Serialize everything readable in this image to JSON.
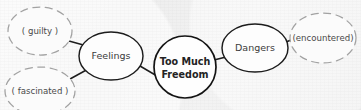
{
  "diagram": {
    "type": "concept-map",
    "background_color": "#f1f1f1",
    "ink_color": "#1c1c1c",
    "dashed_color": "#a2a2a2",
    "nodes": [
      {
        "id": "center",
        "label": "Too Much Freedom",
        "label_line1": "Too Much",
        "label_line2": "Freedom",
        "shape": "circle",
        "border": "solid",
        "emphasis": "bold",
        "cx": 185,
        "cy": 67,
        "rx": 31,
        "ry": 31
      },
      {
        "id": "feelings",
        "label": "Feelings",
        "shape": "ellipse",
        "border": "solid",
        "emphasis": "normal",
        "cx": 111,
        "cy": 56,
        "rx": 32,
        "ry": 24
      },
      {
        "id": "dangers",
        "label": "Dangers",
        "shape": "ellipse",
        "border": "solid",
        "emphasis": "normal",
        "cx": 255,
        "cy": 48,
        "rx": 33,
        "ry": 24
      },
      {
        "id": "guilty",
        "label": "guilty",
        "label_bracketed": "( guilty )",
        "shape": "ellipse",
        "border": "dashed",
        "emphasis": "normal",
        "cx": 40,
        "cy": 31,
        "rx": 32,
        "ry": 24
      },
      {
        "id": "fascinated",
        "label": "fascinated",
        "label_bracketed": "( fascinated )",
        "shape": "ellipse",
        "border": "dashed",
        "emphasis": "normal",
        "cx": 40,
        "cy": 91,
        "rx": 35,
        "ry": 24
      },
      {
        "id": "encountered",
        "label": "encountered",
        "label_bracketed": "(encountered)",
        "shape": "ellipse",
        "border": "dashed",
        "emphasis": "normal",
        "cx": 323,
        "cy": 38,
        "rx": 33,
        "ry": 25
      }
    ],
    "edges": [
      {
        "id": "edge-guilty-feelings",
        "from": "guilty",
        "to": "feelings",
        "x1": 69,
        "y1": 41,
        "x2": 87,
        "y2": 46
      },
      {
        "id": "edge-fascinated-feelings",
        "from": "fascinated",
        "to": "feelings",
        "x1": 70,
        "y1": 79,
        "x2": 90,
        "y2": 68
      },
      {
        "id": "edge-feelings-center",
        "from": "feelings",
        "to": "center",
        "x1": 140,
        "y1": 66,
        "x2": 157,
        "y2": 76
      },
      {
        "id": "edge-center-dangers",
        "from": "center",
        "to": "dangers",
        "x1": 214,
        "y1": 60,
        "x2": 226,
        "y2": 57
      },
      {
        "id": "edge-dangers-encountered",
        "from": "dangers",
        "to": "encountered",
        "x1": 286,
        "y1": 42,
        "x2": 296,
        "y2": 38
      }
    ]
  }
}
